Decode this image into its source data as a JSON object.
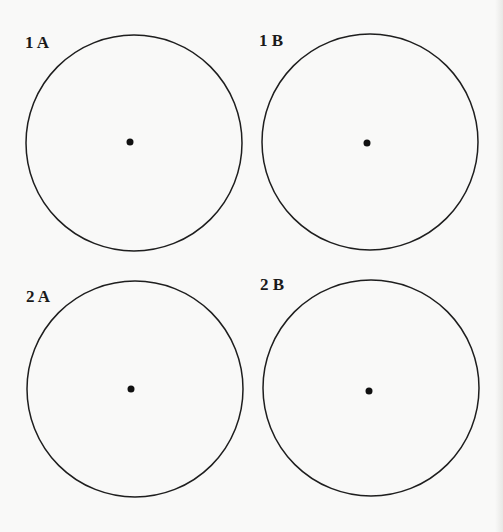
{
  "figures": [
    {
      "label": "1 A",
      "circle": {
        "cx": 134,
        "cy": 143,
        "r": 108
      },
      "dot": {
        "cx": 130,
        "cy": 142,
        "r": 3.5
      },
      "label_pos": {
        "x": 25,
        "y": 33
      }
    },
    {
      "label": "1 B",
      "circle": {
        "cx": 370,
        "cy": 142,
        "r": 108
      },
      "dot": {
        "cx": 367,
        "cy": 143,
        "r": 3.5
      },
      "label_pos": {
        "x": 259,
        "y": 31
      }
    },
    {
      "label": "2 A",
      "circle": {
        "cx": 135,
        "cy": 389,
        "r": 108
      },
      "dot": {
        "cx": 131,
        "cy": 389,
        "r": 3.5
      },
      "label_pos": {
        "x": 26,
        "y": 287
      }
    },
    {
      "label": "2 B",
      "circle": {
        "cx": 371,
        "cy": 388,
        "r": 108
      },
      "dot": {
        "cx": 369,
        "cy": 391,
        "r": 3.5
      },
      "label_pos": {
        "x": 260,
        "y": 275
      }
    }
  ],
  "colors": {
    "stroke": "#1e1e1e",
    "background": "#f9f9f8"
  }
}
